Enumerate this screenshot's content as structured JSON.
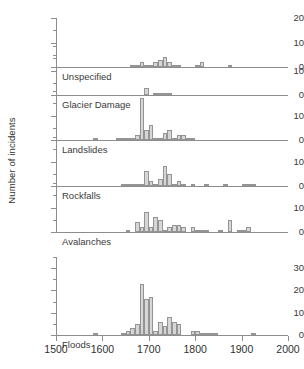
{
  "figure": {
    "ylabel": "Number of incidents",
    "background": "#ffffff",
    "bar_fill": "#d6d6d6",
    "bar_stroke": "#949494",
    "axis_color": "#8d8d8d"
  },
  "xaxis": {
    "min": 1500,
    "max": 2000,
    "ticks": [
      1500,
      1600,
      1700,
      1800,
      1900,
      2000
    ],
    "tick_labels": [
      "1500",
      "1600",
      "1700",
      "1800",
      "1900",
      "2000"
    ],
    "bin_width": 10
  },
  "chart_data": {
    "type": "bar",
    "title": "",
    "xlabel": "",
    "ylabel": "Number of incidents",
    "xlim": [
      1500,
      2000
    ],
    "grid": false,
    "legend": "none",
    "layout": "6 stacked histogram panels sharing one x axis (year)",
    "panels": [
      {
        "label": "Unspecified",
        "ylim": [
          0,
          20
        ],
        "yticks": [
          0,
          10,
          20
        ],
        "ytick_labels": [
          "0",
          "10",
          "20"
        ],
        "yminor": [
          5,
          15
        ],
        "x": [
          1660,
          1670,
          1680,
          1690,
          1700,
          1710,
          1720,
          1730,
          1740,
          1750,
          1760,
          1800,
          1810,
          1870
        ],
        "values": [
          1,
          1,
          2,
          1,
          1,
          2,
          3,
          4,
          2,
          1,
          1,
          1,
          2,
          1
        ]
      },
      {
        "label": "Glacier Damage",
        "ylim": [
          0,
          20
        ],
        "yticks": [
          0,
          10
        ],
        "ytick_labels": [
          "0",
          "10"
        ],
        "yminor": [
          5,
          15,
          20
        ],
        "x": [
          1690,
          1710,
          1720,
          1730,
          1740
        ],
        "values": [
          3,
          1,
          1,
          1,
          1
        ]
      },
      {
        "label": "Landslides",
        "ylim": [
          0,
          20
        ],
        "yticks": [
          0,
          10
        ],
        "ytick_labels": [
          "0",
          "10"
        ],
        "yminor": [
          5,
          15,
          20
        ],
        "x": [
          1580,
          1630,
          1640,
          1650,
          1660,
          1670,
          1680,
          1690,
          1700,
          1710,
          1720,
          1730,
          1740,
          1750,
          1760,
          1770,
          1780,
          1790
        ],
        "values": [
          1,
          1,
          1,
          1,
          1,
          2,
          17,
          4,
          6,
          1,
          1,
          3,
          4,
          1,
          2,
          2,
          1,
          1
        ]
      },
      {
        "label": "Rockfalls",
        "ylim": [
          0,
          20
        ],
        "yticks": [
          0,
          10
        ],
        "ytick_labels": [
          "0",
          "10"
        ],
        "yminor": [
          5,
          15,
          20
        ],
        "x": [
          1640,
          1650,
          1660,
          1670,
          1680,
          1690,
          1700,
          1710,
          1720,
          1730,
          1740,
          1750,
          1760,
          1770,
          1790,
          1820,
          1860,
          1900,
          1910,
          1920
        ],
        "values": [
          1,
          1,
          1,
          1,
          1,
          6,
          2,
          1,
          3,
          8,
          5,
          1,
          2,
          1,
          1,
          1,
          1,
          1,
          1,
          1
        ]
      },
      {
        "label": "Avalanches",
        "ylim": [
          0,
          20
        ],
        "yticks": [
          0,
          10
        ],
        "ytick_labels": [
          "0",
          "10"
        ],
        "yminor": [
          5,
          15,
          20
        ],
        "x": [
          1650,
          1670,
          1680,
          1690,
          1700,
          1710,
          1720,
          1730,
          1740,
          1750,
          1760,
          1770,
          1790,
          1800,
          1810,
          1820,
          1850,
          1870,
          1890,
          1900,
          1910
        ],
        "values": [
          1,
          4,
          2,
          8,
          2,
          6,
          5,
          1,
          2,
          3,
          3,
          2,
          2,
          1,
          1,
          1,
          1,
          5,
          1,
          1,
          2
        ]
      },
      {
        "label": "Floods",
        "ylim": [
          0,
          35
        ],
        "yticks": [
          0,
          10,
          20,
          30
        ],
        "ytick_labels": [
          "0",
          "10",
          "20",
          "30"
        ],
        "yminor": [
          5,
          15,
          25,
          35
        ],
        "x": [
          1580,
          1640,
          1650,
          1660,
          1670,
          1680,
          1690,
          1700,
          1710,
          1720,
          1730,
          1740,
          1750,
          1760,
          1790,
          1800,
          1810,
          1820,
          1830,
          1840,
          1920
        ],
        "values": [
          1,
          1,
          2,
          3,
          5,
          23,
          16,
          17,
          2,
          6,
          4,
          8,
          6,
          5,
          2,
          2,
          1,
          1,
          1,
          1,
          1
        ]
      }
    ]
  }
}
